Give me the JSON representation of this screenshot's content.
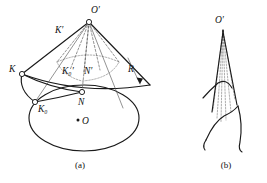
{
  "figure": {
    "panels": [
      {
        "id": "a",
        "caption": "(a)",
        "description": "Cone developed sector over elliptical base",
        "labels": {
          "apex": "O",
          "apex_prime_mark": "′",
          "apex_full": "O′",
          "sector_left_point": "K",
          "sector_left_prime": "K′",
          "base_point_left": "K",
          "base_point_left_sub": "0",
          "base_point_left_full": "K₀",
          "mid_point_left_prime": "K",
          "mid_point_left_prime_sub": "0",
          "mid_point_left_prime_full": "K₀′",
          "mid_point_right_prime": "N′",
          "tangent_point": "N",
          "ellipse_center": "O",
          "radius": "R"
        }
      },
      {
        "id": "b",
        "caption": "(b)",
        "description": "Apex with radiating generator lines to wavy curve",
        "labels": {
          "apex_full": "O′"
        }
      }
    ],
    "colors": {
      "background": "#ffffff",
      "ink": "#1a1a1a",
      "thin_ink": "#4a4a4a",
      "dashed_ink": "#5a5a5a"
    }
  }
}
